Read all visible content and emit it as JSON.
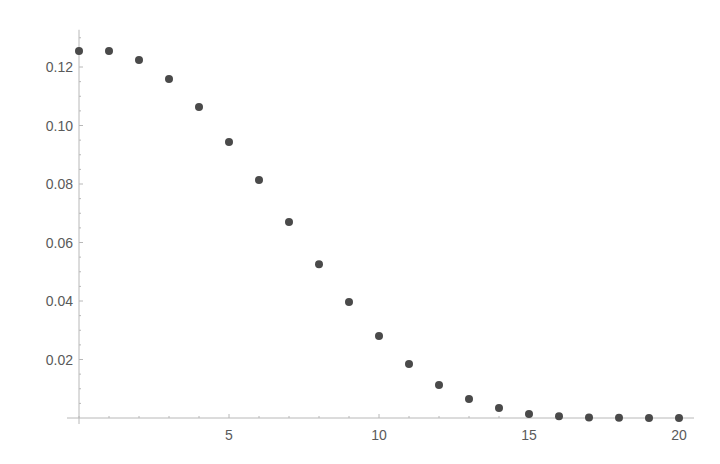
{
  "chart_data": {
    "type": "scatter",
    "title": "",
    "xlabel": "",
    "ylabel": "",
    "xlim": [
      -0.4,
      20.5
    ],
    "ylim": [
      0,
      0.13
    ],
    "grid": false,
    "legend": null,
    "x_ticks": [
      5,
      10,
      15,
      20
    ],
    "x_tick_labels": [
      "5",
      "10",
      "15",
      "20"
    ],
    "y_ticks": [
      0.02,
      0.04,
      0.06,
      0.08,
      0.1,
      0.12
    ],
    "y_tick_labels": [
      "0.02",
      "0.04",
      "0.06",
      "0.08",
      "0.10",
      "0.12"
    ],
    "series": [
      {
        "name": "points",
        "color": "#4a4a4a",
        "x": [
          0,
          1,
          2,
          3,
          4,
          5,
          6,
          7,
          8,
          9,
          10,
          11,
          12,
          13,
          14,
          15,
          16,
          17,
          18,
          19,
          20
        ],
        "y": [
          0.1255,
          0.1255,
          0.1224,
          0.1159,
          0.1063,
          0.0944,
          0.0814,
          0.067,
          0.0526,
          0.0397,
          0.028,
          0.0185,
          0.0113,
          0.0065,
          0.0034,
          0.0014,
          0.0006,
          0.0002,
          0.0001,
          0.0,
          0.0
        ]
      }
    ]
  },
  "layout": {
    "x0_px": 79,
    "px_per_x": 30,
    "y0_px": 418,
    "px_per_y": 2925,
    "axis_color": "#b8b8b8",
    "text_color": "#5a5a5a"
  }
}
